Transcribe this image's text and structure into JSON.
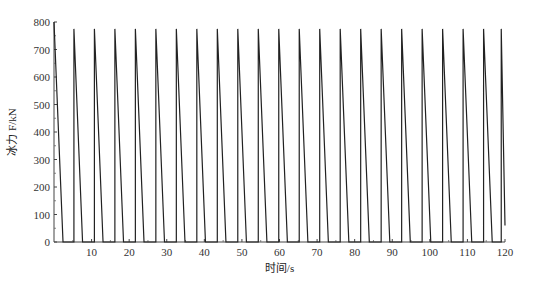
{
  "chart_data": {
    "type": "line",
    "title": "",
    "xlabel": "时间/s",
    "ylabel": "冰力 F/kN",
    "xlim": [
      0,
      120
    ],
    "ylim": [
      0,
      800
    ],
    "xticks": [
      10,
      20,
      30,
      40,
      50,
      60,
      70,
      80,
      90,
      100,
      110,
      120
    ],
    "yticks": [
      0,
      100,
      200,
      300,
      400,
      500,
      600,
      700,
      800
    ],
    "grid": false,
    "legend": null,
    "series": [
      {
        "name": "冰力",
        "color": "#222222",
        "description": "Periodic sawtooth ice force: vertical rise to ~775 kN, linear drop to 0 over ~2.3 s, zero plateau ~3.1 s; period ~5.45 s; 22 teeth",
        "period_s": 5.45,
        "peak_kN": 775,
        "decay_s": 2.3,
        "x": [
          0,
          2.4,
          5.3,
          5.3,
          7.6,
          10.75,
          10.75,
          13.05,
          16.2,
          16.2,
          18.5,
          21.65,
          21.65,
          23.95,
          27.1,
          27.1,
          29.4,
          32.55,
          32.55,
          34.85,
          38.0,
          38.0,
          40.3,
          43.45,
          43.45,
          45.75,
          48.9,
          48.9,
          51.2,
          54.35,
          54.35,
          56.65,
          59.8,
          59.8,
          62.1,
          65.25,
          65.25,
          67.55,
          70.7,
          70.7,
          73.0,
          76.15,
          76.15,
          78.45,
          81.6,
          81.6,
          83.9,
          87.05,
          87.05,
          89.35,
          92.5,
          92.5,
          94.8,
          97.95,
          97.95,
          100.25,
          103.4,
          103.4,
          105.7,
          108.85,
          108.85,
          111.15,
          114.3,
          114.3,
          116.6,
          119.0,
          119.0,
          120.0
        ],
        "y": [
          800,
          0,
          0,
          775,
          0,
          0,
          775,
          0,
          0,
          775,
          0,
          0,
          775,
          0,
          0,
          775,
          0,
          0,
          775,
          0,
          0,
          775,
          0,
          0,
          775,
          0,
          0,
          775,
          0,
          0,
          775,
          0,
          0,
          775,
          0,
          0,
          775,
          0,
          0,
          775,
          0,
          0,
          775,
          0,
          0,
          775,
          0,
          0,
          775,
          0,
          0,
          775,
          0,
          0,
          775,
          0,
          0,
          775,
          0,
          0,
          775,
          0,
          0,
          775,
          0,
          0,
          775,
          60
        ]
      }
    ]
  },
  "plot_area": {
    "left": 54,
    "top": 22,
    "right": 505,
    "bottom": 242
  }
}
